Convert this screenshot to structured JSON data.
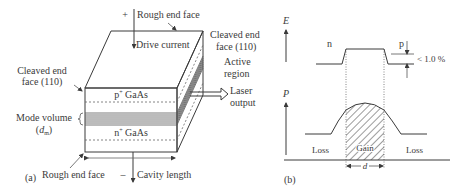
{
  "panel_a": {
    "label": "(a)",
    "plus_sign": "+",
    "minus_sign": "–",
    "rough_end_face_top": "Rough end face",
    "drive_current": "Drive current",
    "cleaved_right_line1": "Cleaved end",
    "cleaved_right_line2": "face (110)",
    "cleaved_left_line1": "Cleaved end",
    "cleaved_left_line2": "face (110)",
    "active_region_line1": "Active",
    "active_region_line2": "region",
    "laser_output_line1": "Laser",
    "laser_output_line2": "output",
    "p_layer": "p",
    "p_layer_sup": "+",
    "p_layer_material": " GaAs",
    "n_layer": "n",
    "n_layer_sup": "+",
    "n_layer_material": " GaAs",
    "mode_volume_line1": "Mode volume",
    "mode_volume_symbol": "d",
    "mode_volume_sub": "m",
    "rough_end_face_bottom": "Rough end face",
    "cavity_length": "Cavity length"
  },
  "panel_b": {
    "label": "(b)",
    "energy_axis": "E",
    "power_axis": "P",
    "n_label": "n",
    "p_label": "p",
    "index_step": "< 1.0 %",
    "gain_label": "Gain",
    "loss_left": "Loss",
    "loss_right": "Loss",
    "width_label": "d"
  },
  "colors": {
    "line": "#3a3a3a",
    "background": "#ffffff"
  }
}
